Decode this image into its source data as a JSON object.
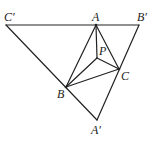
{
  "diagram": {
    "type": "geometry",
    "points": {
      "A": {
        "label": "A",
        "x": 96,
        "y": 25
      },
      "B": {
        "label": "B",
        "x": 66,
        "y": 87
      },
      "C": {
        "label": "C",
        "x": 119,
        "y": 69
      },
      "P": {
        "label": "P",
        "x": 97,
        "y": 58
      },
      "A_prime": {
        "label": "A′",
        "x": 97,
        "y": 120
      },
      "B_prime": {
        "label": "B′",
        "x": 139,
        "y": 25
      },
      "C_prime": {
        "label": "C′",
        "x": 6,
        "y": 25
      }
    },
    "segments": [
      [
        "C_prime",
        "B_prime"
      ],
      [
        "C_prime",
        "A_prime"
      ],
      [
        "B_prime",
        "A_prime"
      ],
      [
        "A",
        "B"
      ],
      [
        "A",
        "C"
      ],
      [
        "B",
        "C"
      ],
      [
        "A",
        "P"
      ],
      [
        "B",
        "P"
      ],
      [
        "C",
        "P"
      ]
    ],
    "stroke_color": "#222222"
  }
}
